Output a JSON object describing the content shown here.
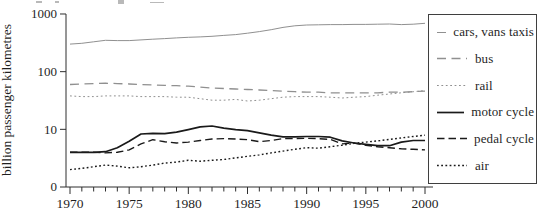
{
  "figure": {
    "y_axis_label": "billion passenger kilometres",
    "y_tick_labels": [
      "1000",
      "100",
      "10",
      "0"
    ],
    "x_tick_labels": [
      "1970",
      "1975",
      "1980",
      "1985",
      "1990",
      "1995",
      "2000"
    ]
  },
  "colors": {
    "gray_series": "#909090",
    "black_series": "#1a1a1a",
    "axis": "#2e2e2e",
    "text": "#1f1f1f",
    "legend_border": "#3f3f3f",
    "background": "#ffffff"
  },
  "legend": {
    "position": "right",
    "items": [
      {
        "series_index": 0
      },
      {
        "series_index": 1
      },
      {
        "series_index": 2
      },
      {
        "series_index": 3
      },
      {
        "series_index": 4
      },
      {
        "series_index": 5
      }
    ]
  },
  "chart_data": {
    "type": "line",
    "title": "",
    "xlabel": "",
    "ylabel": "billion passenger kilometres",
    "y_scale": "log",
    "ylim": [
      1,
      1000
    ],
    "y_tick_values": [
      1000,
      100,
      10,
      0
    ],
    "xlim": [
      1970,
      2000
    ],
    "x_major_ticks": [
      1970,
      1975,
      1980,
      1985,
      1990,
      1995,
      2000
    ],
    "x_minor_tick_step": 1,
    "grid": false,
    "legend_position": "right",
    "x": [
      1970,
      1971,
      1972,
      1973,
      1974,
      1975,
      1976,
      1977,
      1978,
      1979,
      1980,
      1981,
      1982,
      1983,
      1984,
      1985,
      1986,
      1987,
      1988,
      1989,
      1990,
      1991,
      1992,
      1993,
      1994,
      1995,
      1996,
      1997,
      1998,
      1999,
      2000
    ],
    "series": [
      {
        "name": "cars, vans taxis",
        "key": "cars-vans-taxis",
        "color": "#909090",
        "width": 1.0,
        "dash": "",
        "values": [
          300,
          310,
          330,
          350,
          345,
          345,
          355,
          365,
          375,
          385,
          395,
          400,
          410,
          425,
          440,
          465,
          495,
          535,
          585,
          625,
          645,
          650,
          655,
          655,
          660,
          660,
          665,
          670,
          655,
          665,
          690
        ]
      },
      {
        "name": "bus",
        "key": "bus",
        "color": "#909090",
        "width": 1.3,
        "dash": "9 5.5",
        "values": [
          60,
          61,
          62,
          63,
          62,
          61,
          60,
          59,
          58,
          57,
          56,
          54,
          52,
          51,
          50,
          49,
          48,
          47,
          46,
          45,
          44,
          44,
          43,
          43,
          43,
          43,
          43,
          44,
          44,
          45,
          46
        ]
      },
      {
        "name": "rail",
        "key": "rail",
        "color": "#909090",
        "width": 1.0,
        "dash": "1.8 2.6",
        "values": [
          38,
          37,
          37,
          38,
          38,
          38,
          37,
          37,
          37,
          36,
          36,
          34,
          32,
          32,
          33,
          31,
          32,
          34,
          36,
          37,
          37,
          37,
          36,
          35,
          36,
          37,
          39,
          41,
          43,
          45,
          47
        ]
      },
      {
        "name": "motor cycle",
        "key": "motor-cycle",
        "color": "#1a1a1a",
        "width": 1.7,
        "dash": "",
        "values": [
          4.0,
          4.0,
          4.0,
          4.1,
          4.8,
          6.2,
          8.3,
          8.5,
          8.4,
          8.9,
          9.9,
          11.0,
          11.4,
          10.5,
          9.9,
          9.5,
          8.7,
          7.9,
          7.4,
          7.4,
          7.5,
          7.5,
          7.3,
          6.3,
          5.8,
          5.5,
          5.2,
          5.2,
          6.0,
          6.4,
          6.4
        ]
      },
      {
        "name": "pedal cycle",
        "key": "pedal-cycle",
        "color": "#1a1a1a",
        "width": 1.4,
        "dash": "7.5 4",
        "values": [
          4.0,
          4.0,
          4.0,
          3.9,
          4.0,
          4.4,
          5.6,
          6.6,
          6.1,
          5.8,
          6.0,
          6.4,
          6.8,
          6.9,
          6.8,
          6.6,
          6.1,
          6.4,
          6.9,
          6.9,
          7.0,
          6.9,
          6.7,
          5.6,
          5.8,
          5.3,
          5.0,
          4.8,
          4.6,
          4.5,
          4.4
        ]
      },
      {
        "name": "air",
        "key": "air",
        "color": "#1a1a1a",
        "width": 1.4,
        "dash": "1.8 2.4",
        "values": [
          2.0,
          2.1,
          2.25,
          2.4,
          2.3,
          2.15,
          2.25,
          2.4,
          2.6,
          2.7,
          2.9,
          2.8,
          2.9,
          3.0,
          3.2,
          3.4,
          3.6,
          3.9,
          4.2,
          4.5,
          4.8,
          4.7,
          5.0,
          5.3,
          5.7,
          6.0,
          6.3,
          6.7,
          7.1,
          7.5,
          7.9
        ]
      }
    ]
  }
}
